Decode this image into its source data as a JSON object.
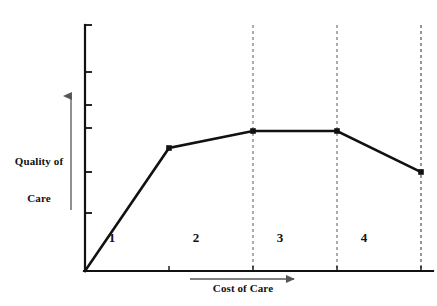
{
  "chart_data": {
    "type": "line",
    "title": "",
    "xlabel": "Cost of Care",
    "ylabel": "Quality of\nCare",
    "ylabel_line1": "Quality of",
    "ylabel_line2": "Care",
    "xlim": [
      0,
      4
    ],
    "ylim": [
      0,
      1
    ],
    "grid": false,
    "legend": "none",
    "axis_ticks": {
      "x_tick_labels": [],
      "y_tick_labels": [],
      "y_tick_count": 6,
      "x_tick_count": 4
    },
    "axis_arrows": {
      "y_arrow_direction": "up",
      "x_arrow_direction": "right"
    },
    "series": [
      {
        "name": "Quality of Care",
        "x": [
          0,
          1,
          2,
          3,
          4
        ],
        "y": [
          0.0,
          0.5,
          0.57,
          0.57,
          0.4
        ],
        "markers": [
          false,
          true,
          true,
          true,
          true
        ],
        "color": "#111111"
      }
    ],
    "zone_dividers_x": [
      1,
      2,
      3,
      4
    ],
    "zones": [
      {
        "label": "1",
        "from_x": 0,
        "to_x": 1
      },
      {
        "label": "2",
        "from_x": 1,
        "to_x": 2
      },
      {
        "label": "3",
        "from_x": 2,
        "to_x": 3
      },
      {
        "label": "4",
        "from_x": 3,
        "to_x": 4
      }
    ],
    "annotations": []
  },
  "geometry": {
    "origin_x": 85,
    "origin_y": 271,
    "axis_top_y": 25,
    "axis_right_x": 433,
    "dashed_x": [
      169,
      253,
      337,
      421
    ],
    "y_ticks_y": [
      25,
      72,
      105,
      128,
      172,
      213
    ],
    "points": [
      {
        "x": 85,
        "y": 271
      },
      {
        "x": 169,
        "y": 148
      },
      {
        "x": 253,
        "y": 131
      },
      {
        "x": 337,
        "y": 131
      },
      {
        "x": 421,
        "y": 172
      }
    ],
    "polyline": "85,271 169,148 253,131 337,131 421,172",
    "marker_points": [
      {
        "x": 169,
        "y": 148
      },
      {
        "x": 253,
        "y": 131
      },
      {
        "x": 337,
        "y": 131
      },
      {
        "x": 421,
        "y": 172
      }
    ],
    "zone_label_x": [
      112,
      196,
      280,
      364
    ],
    "y_arrow": {
      "x": 71,
      "y_bottom": 210,
      "y_top": 93
    },
    "x_arrow": {
      "y": 279,
      "x_left": 190,
      "x_right": 297
    }
  },
  "style": {
    "axis_color": "#111111",
    "line_color": "#111111",
    "dash_color": "#8a8a8a",
    "arrow_color": "#555555",
    "background": "#ffffff",
    "line_width": 2.6,
    "axis_width": 2.2,
    "dash_pattern": "3,3"
  }
}
